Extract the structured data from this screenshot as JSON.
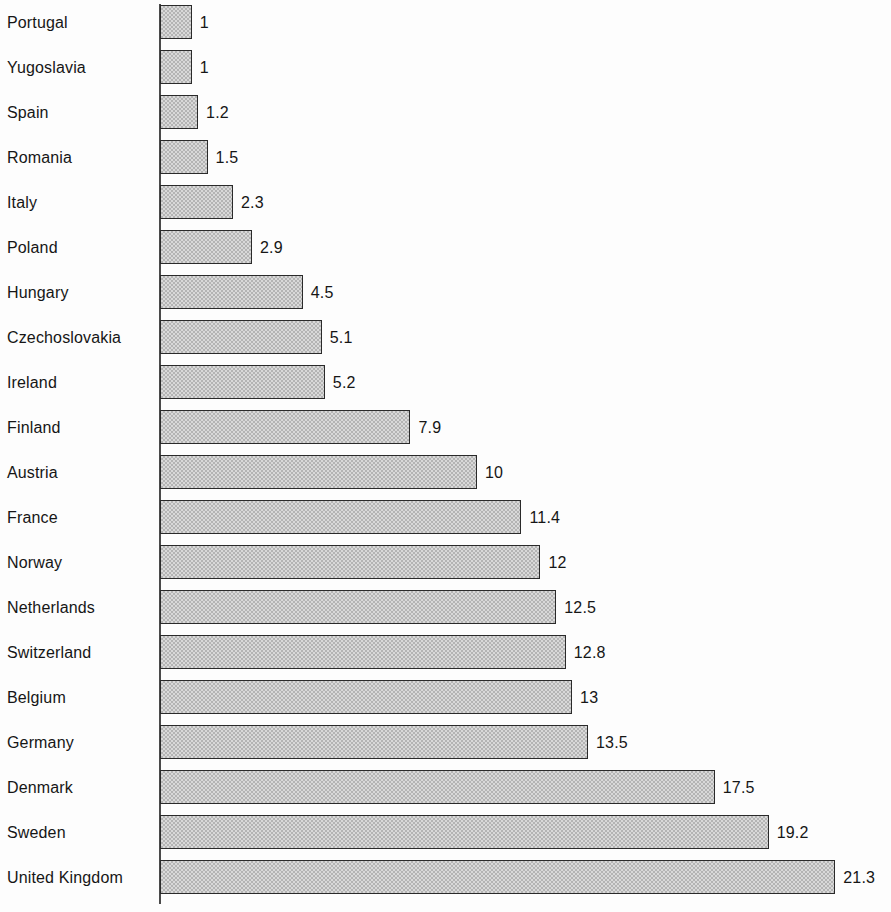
{
  "chart_data": {
    "type": "bar",
    "orientation": "horizontal",
    "title": "",
    "xlabel": "",
    "ylabel": "",
    "grid": false,
    "legend": null,
    "xlim": [
      0,
      21.3
    ],
    "categories": [
      "Portugal",
      "Yugoslavia",
      "Spain",
      "Romania",
      "Italy",
      "Poland",
      "Hungary",
      "Czechoslovakia",
      "Ireland",
      "Finland",
      "Austria",
      "France",
      "Norway",
      "Netherlands",
      "Switzerland",
      "Belgium",
      "Germany",
      "Denmark",
      "Sweden",
      "United Kingdom"
    ],
    "values": [
      1,
      1,
      1.2,
      1.5,
      2.3,
      2.9,
      4.5,
      5.1,
      5.2,
      7.9,
      10,
      11.4,
      12,
      12.5,
      12.8,
      13,
      13.5,
      17.5,
      19.2,
      21.3
    ],
    "value_labels": [
      "1",
      "1",
      "1.2",
      "1.5",
      "2.3",
      "2.9",
      "4.5",
      "5.1",
      "5.2",
      "7.9",
      "10",
      "11.4",
      "12",
      "12.5",
      "12.8",
      "13",
      "13.5",
      "17.5",
      "19.2",
      "21.3"
    ],
    "bar_fill_color": "#d9d9d9",
    "bar_border_color": "#2a2a2a",
    "axis_color": "#4a4a4a",
    "text_color": "#161616"
  },
  "layout": {
    "axis_x": 160,
    "row_pitch": 45,
    "row_top": 0,
    "bar_height": 34,
    "bar_top_offset": 5,
    "px_per_unit": 31.7,
    "value_gap": 8,
    "label_left": 7
  }
}
